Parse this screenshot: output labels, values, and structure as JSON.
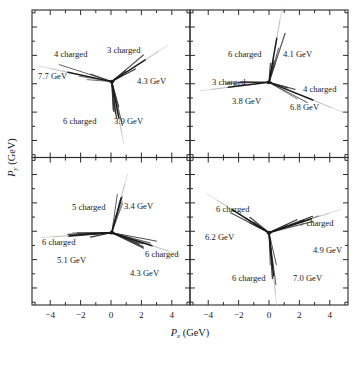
{
  "figure": {
    "xlabel_symbol": "P",
    "xlabel_sub": "x",
    "xlabel_unit": "(GeV)",
    "ylabel_symbol": "P",
    "ylabel_sub": "y",
    "ylabel_unit": "(GeV)"
  },
  "axes": {
    "xticks": [
      "−4",
      "−2",
      "0",
      "2",
      "4"
    ],
    "xtickvals": [
      -4,
      -2,
      0,
      2,
      4
    ],
    "xlim": [
      -5.2,
      5.2
    ],
    "ylim": [
      -5.2,
      5.2
    ],
    "minor_tick_step": 1,
    "grid": false
  },
  "chart_data": {
    "type": "scatter",
    "title": "",
    "xlabel": "P_x (GeV)",
    "ylabel": "P_y (GeV)",
    "xlim": [
      -5.2,
      5.2
    ],
    "ylim": [
      -5.2,
      5.2
    ],
    "panels": [
      {
        "id": "panel-top-left",
        "position": "top-left",
        "vertex": [
          0.05,
          0.15
        ],
        "jets": [
          {
            "label_charged": "4 charged",
            "label_energy": "7.7 GeV",
            "charged": 4,
            "energy_gev": 7.7,
            "angle_deg": 168,
            "length": 3.6
          },
          {
            "label_charged": "3 charged",
            "label_energy": "4.3 GeV",
            "charged": 3,
            "energy_gev": 4.3,
            "angle_deg": 33,
            "length": 3.2
          },
          {
            "label_charged": "6 charged",
            "label_energy": "3.9 GeV",
            "charged": 6,
            "energy_gev": 3.9,
            "angle_deg": -79,
            "length": 3.0
          }
        ]
      },
      {
        "id": "panel-top-right",
        "position": "top-right",
        "vertex": [
          0.0,
          0.1
        ],
        "jets": [
          {
            "label_charged": "6 charged",
            "label_energy": "4.1 GeV",
            "charged": 6,
            "energy_gev": 4.1,
            "angle_deg": 80,
            "length": 3.6
          },
          {
            "label_charged": "3 charged",
            "label_energy": "3.8 GeV",
            "charged": 3,
            "energy_gev": 3.8,
            "angle_deg": 187,
            "length": 3.3
          },
          {
            "label_charged": "4 charged",
            "label_energy": "6.8 GeV",
            "charged": 4,
            "energy_gev": 6.8,
            "angle_deg": -22,
            "length": 3.8
          }
        ]
      },
      {
        "id": "panel-bottom-left",
        "position": "bottom-left",
        "vertex": [
          0.05,
          -0.1
        ],
        "jets": [
          {
            "label_charged": "5 charged",
            "label_energy": "3.4 GeV",
            "charged": 5,
            "energy_gev": 3.4,
            "angle_deg": 75,
            "length": 2.9
          },
          {
            "label_charged": "6 charged",
            "label_energy": "5.1 GeV",
            "charged": 6,
            "energy_gev": 5.1,
            "angle_deg": 184,
            "length": 3.4
          },
          {
            "label_charged": "6 charged",
            "label_energy": "4.3 GeV",
            "charged": 6,
            "energy_gev": 4.3,
            "angle_deg": -18,
            "length": 3.4
          }
        ]
      },
      {
        "id": "panel-bottom-right",
        "position": "bottom-right",
        "vertex": [
          0.0,
          -0.1
        ],
        "jets": [
          {
            "label_charged": "6 charged",
            "label_energy": "6.2 GeV",
            "charged": 6,
            "energy_gev": 6.2,
            "angle_deg": 148,
            "length": 3.5
          },
          {
            "label_charged": "7 charged",
            "label_energy": "4.9 GeV",
            "charged": 7,
            "energy_gev": 4.9,
            "angle_deg": 18,
            "length": 3.6
          },
          {
            "label_charged": "6 charged",
            "label_energy": "7.0 GeV",
            "charged": 6,
            "energy_gev": 7.0,
            "angle_deg": -84,
            "length": 3.5
          }
        ]
      }
    ]
  },
  "annotations": {
    "panel-top-left": [
      {
        "name": "jet-label-4-charged",
        "text": "4 charged",
        "x": 54,
        "y": 57
      },
      {
        "name": "jet-label-7-7-gev",
        "text": "7.7 GeV",
        "x": 38,
        "y": 79
      },
      {
        "name": "jet-label-3-charged",
        "text": "3 charged",
        "x": 107,
        "y": 53
      },
      {
        "name": "jet-label-4-3-gev",
        "text": "4.3 GeV",
        "x": 137,
        "y": 84
      },
      {
        "name": "jet-label-6-charged",
        "text": "6 charged",
        "x": 63,
        "y": 124
      },
      {
        "name": "jet-label-3-9-gev",
        "text": "3.9 GeV",
        "x": 114,
        "y": 124
      }
    ],
    "panel-top-right": [
      {
        "name": "jet-label-6-charged",
        "text": "6 charged",
        "x": 228,
        "y": 57
      },
      {
        "name": "jet-label-4-1-gev",
        "text": "4.1 GeV",
        "x": 283,
        "y": 57
      },
      {
        "name": "jet-label-3-charged",
        "text": "3 charged",
        "x": 212,
        "y": 85
      },
      {
        "name": "jet-label-3-8-gev",
        "text": "3.8 GeV",
        "x": 232,
        "y": 104
      },
      {
        "name": "jet-label-4-charged",
        "text": "4 charged",
        "x": 303,
        "y": 92
      },
      {
        "name": "jet-label-6-8-gev",
        "text": "6.8 GeV",
        "x": 290,
        "y": 110
      }
    ],
    "panel-bottom-left": [
      {
        "name": "jet-label-5-charged",
        "text": "5 charged",
        "x": 72,
        "y": 210
      },
      {
        "name": "jet-label-3-4-gev",
        "text": "3.4 GeV",
        "x": 124,
        "y": 209
      },
      {
        "name": "jet-label-6-charged-left",
        "text": "6 charged",
        "x": 42,
        "y": 245
      },
      {
        "name": "jet-label-5-1-gev",
        "text": "5.1 GeV",
        "x": 57,
        "y": 263
      },
      {
        "name": "jet-label-6-charged-right",
        "text": "6 charged",
        "x": 145,
        "y": 257
      },
      {
        "name": "jet-label-4-3-gev",
        "text": "4.3 GeV",
        "x": 130,
        "y": 276
      }
    ],
    "panel-bottom-right": [
      {
        "name": "jet-label-6-charged-left",
        "text": "6 charged",
        "x": 216,
        "y": 212
      },
      {
        "name": "jet-label-6-2-gev",
        "text": "6.2 GeV",
        "x": 205,
        "y": 240
      },
      {
        "name": "jet-label-7-charged",
        "text": "7 charged",
        "x": 300,
        "y": 226
      },
      {
        "name": "jet-label-4-9-gev",
        "text": "4.9 GeV",
        "x": 313,
        "y": 253
      },
      {
        "name": "jet-label-6-charged-bottom",
        "text": "6 charged",
        "x": 232,
        "y": 281
      },
      {
        "name": "jet-label-7-0-gev",
        "text": "7.0 GeV",
        "x": 293,
        "y": 281
      }
    ]
  }
}
